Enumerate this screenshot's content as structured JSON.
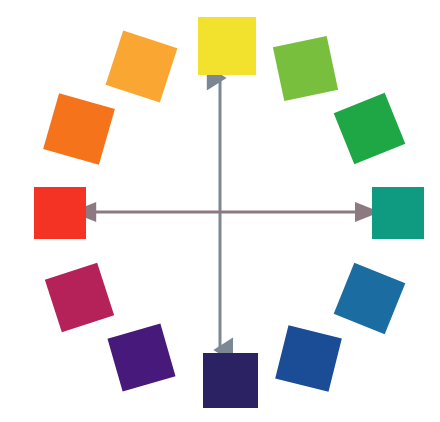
{
  "figure": {
    "background": "#ffffff",
    "width": 440,
    "height": 422,
    "center": {
      "x": 220,
      "y": 211
    },
    "radius": 165
  },
  "chart_data": {
    "type": "pie",
    "subtitle": "Twelve-hue color wheel with complementary axes",
    "xlabel": "",
    "ylabel": "",
    "legend_position": "none",
    "grid": false,
    "categories": [
      "Yellow",
      "Yellow-Green",
      "Green",
      "Blue-Green",
      "Blue",
      "Blue-Violet",
      "Violet",
      "Red-Violet",
      "Red-Purple",
      "Red",
      "Orange",
      "Yellow-Orange"
    ],
    "values": [
      30,
      30,
      30,
      30,
      30,
      30,
      30,
      30,
      30,
      30,
      30,
      30
    ],
    "colors": [
      "#f2e22e",
      "#77bf3c",
      "#1fa746",
      "#0e9b82",
      "#1b6ca0",
      "#1b4c96",
      "#2a2263",
      "#47197a",
      "#b5225a",
      "#f53324",
      "#f4731b",
      "#f9a633"
    ],
    "angles_deg": [
      0,
      30,
      60,
      90,
      120,
      150,
      180,
      210,
      240,
      270,
      300,
      330
    ]
  },
  "swatches": [
    {
      "name": "yellow",
      "label": "Yellow",
      "color": "#f2e22e",
      "angle": 0,
      "size": 58,
      "rotation": 0,
      "left": 198,
      "top": 17
    },
    {
      "name": "yellow-green",
      "label": "Yellow-Green",
      "color": "#77bf3c",
      "angle": 30,
      "size": 55,
      "rotation": -12,
      "left": 278,
      "top": 41
    },
    {
      "name": "green",
      "label": "Green",
      "color": "#1fa746",
      "angle": 60,
      "size": 55,
      "rotation": -22,
      "left": 342,
      "top": 101
    },
    {
      "name": "blue-green",
      "label": "Blue-Green",
      "color": "#0e9b82",
      "angle": 90,
      "size": 52,
      "rotation": 0,
      "left": 372,
      "top": 187
    },
    {
      "name": "blue",
      "label": "Blue",
      "color": "#1b6ca0",
      "angle": 120,
      "size": 55,
      "rotation": 22,
      "left": 342,
      "top": 271
    },
    {
      "name": "blue-violet",
      "label": "Blue-Violet",
      "color": "#1b4c96",
      "angle": 150,
      "size": 55,
      "rotation": 14,
      "left": 281,
      "top": 331
    },
    {
      "name": "violet",
      "label": "Violet",
      "color": "#2a2263",
      "angle": 180,
      "size": 55,
      "rotation": 0,
      "left": 203,
      "top": 353
    },
    {
      "name": "red-violet",
      "label": "Red-Violet",
      "color": "#47197a",
      "angle": 210,
      "size": 55,
      "rotation": -16,
      "left": 114,
      "top": 330
    },
    {
      "name": "red-purple",
      "label": "Red-Purple",
      "color": "#b5225a",
      "angle": 240,
      "size": 55,
      "rotation": -18,
      "left": 52,
      "top": 270
    },
    {
      "name": "red",
      "label": "Red",
      "color": "#f53324",
      "angle": 270,
      "size": 52,
      "rotation": 0,
      "left": 34,
      "top": 187
    },
    {
      "name": "orange",
      "label": "Orange",
      "color": "#f4731b",
      "angle": 300,
      "size": 58,
      "rotation": 16,
      "left": 50,
      "top": 100
    },
    {
      "name": "yellow-orange",
      "label": "Yellow-Orange",
      "color": "#f9a633",
      "angle": 330,
      "size": 57,
      "rotation": 18,
      "left": 113,
      "top": 38
    }
  ],
  "axes": [
    {
      "name": "vertical-complement-axis",
      "label": "Yellow to Violet complementary axis",
      "color": "#7b8793",
      "orientation": "vertical",
      "from": "yellow",
      "to": "violet",
      "x1": 220,
      "y1": 78,
      "x2": 220,
      "y2": 350,
      "stroke_width": 3,
      "arrow_size": 9
    },
    {
      "name": "horizontal-complement-axis",
      "label": "Red to Blue-Green complementary axis",
      "color": "#8c7a80",
      "orientation": "horizontal",
      "from": "red",
      "to": "blue-green",
      "x1": 86,
      "y1": 212,
      "x2": 370,
      "y2": 212,
      "stroke_width": 3,
      "arrow_size": 9
    }
  ]
}
